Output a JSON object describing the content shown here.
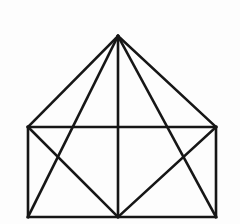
{
  "figure": {
    "type": "line-drawing",
    "background_color": "#fdfdfd",
    "stroke_color": "#161616",
    "stroke_width": 2.6,
    "canvas": {
      "width": 240,
      "height": 224
    },
    "vertices": {
      "apex": {
        "name": "apex",
        "x": 118,
        "y": 36
      },
      "top_left": {
        "name": "top-left",
        "x": 28,
        "y": 127
      },
      "top_right": {
        "name": "top-right",
        "x": 216,
        "y": 127
      },
      "bottom_left": {
        "name": "bottom-left",
        "x": 28,
        "y": 217
      },
      "bottom_right": {
        "name": "bottom-right",
        "x": 216,
        "y": 217
      },
      "bottom_mid": {
        "name": "bottom-mid",
        "x": 118,
        "y": 217
      },
      "top_mid": {
        "name": "top-mid",
        "x": 118,
        "y": 127
      }
    },
    "segments": [
      {
        "id": "roof-left",
        "label": "apex to top-left",
        "x1": 118,
        "y1": 36,
        "x2": 28,
        "y2": 127
      },
      {
        "id": "roof-right",
        "label": "apex to top-right",
        "x1": 118,
        "y1": 36,
        "x2": 216,
        "y2": 127
      },
      {
        "id": "rect-top",
        "label": "top edge of rectangle",
        "x1": 28,
        "y1": 127,
        "x2": 216,
        "y2": 127
      },
      {
        "id": "rect-left",
        "label": "left edge of rectangle",
        "x1": 28,
        "y1": 127,
        "x2": 28,
        "y2": 217
      },
      {
        "id": "rect-right",
        "label": "right edge of rectangle",
        "x1": 216,
        "y1": 127,
        "x2": 216,
        "y2": 217
      },
      {
        "id": "rect-bottom",
        "label": "bottom edge of rectangle",
        "x1": 28,
        "y1": 217,
        "x2": 216,
        "y2": 217
      },
      {
        "id": "center-vertical",
        "label": "apex to bottom-mid",
        "x1": 118,
        "y1": 36,
        "x2": 118,
        "y2": 217
      },
      {
        "id": "long-diag-left",
        "label": "apex to bottom-left",
        "x1": 118,
        "y1": 36,
        "x2": 28,
        "y2": 217
      },
      {
        "id": "long-diag-right",
        "label": "apex to bottom-right",
        "x1": 118,
        "y1": 36,
        "x2": 216,
        "y2": 217
      },
      {
        "id": "low-diag-left",
        "label": "top-left to bottom-mid",
        "x1": 28,
        "y1": 127,
        "x2": 118,
        "y2": 217
      },
      {
        "id": "low-diag-right",
        "label": "top-right to bottom-mid",
        "x1": 216,
        "y1": 127,
        "x2": 118,
        "y2": 217
      }
    ]
  }
}
